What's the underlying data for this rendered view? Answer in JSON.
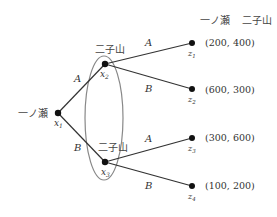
{
  "diagram": {
    "type": "game-tree",
    "header": {
      "player1": "一ノ瀬",
      "player2": "二子山"
    },
    "nodes": {
      "x1": {
        "player": "一ノ瀬",
        "label": "x",
        "sub": "1"
      },
      "x2": {
        "player": "二子山",
        "label": "x",
        "sub": "2"
      },
      "x3": {
        "player": "二子山",
        "label": "x",
        "sub": "3"
      }
    },
    "edges": {
      "x1_x2": "A",
      "x1_x3": "B",
      "x2_z1": "A",
      "x2_z2": "B",
      "x3_z3": "A",
      "x3_z4": "B"
    },
    "terminals": [
      {
        "label": "z",
        "sub": "1",
        "payoff": "(200, 400)"
      },
      {
        "label": "z",
        "sub": "2",
        "payoff": "(600, 300)"
      },
      {
        "label": "z",
        "sub": "3",
        "payoff": "(300, 600)"
      },
      {
        "label": "z",
        "sub": "4",
        "payoff": "(100, 200)"
      }
    ],
    "information_set": "x2-x3"
  }
}
